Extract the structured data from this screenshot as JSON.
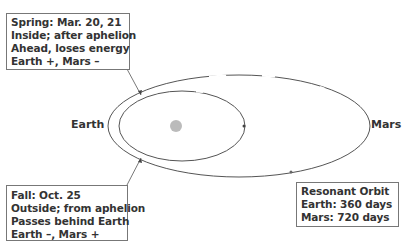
{
  "diagram": {
    "labels": {
      "earth": "Earth",
      "mars": "Mars"
    },
    "spring_box": {
      "lines": [
        "Spring: Mar. 20, 21",
        "Inside; after aphelion",
        "Ahead, loses energy",
        "Earth +, Mars –"
      ]
    },
    "fall_box": {
      "lines": [
        "Fall: Oct. 25",
        "Outside; from aphelion",
        "Passes behind Earth",
        "Earth –, Mars +"
      ]
    },
    "resonant_box": {
      "lines": [
        "Resonant Orbit",
        "Earth: 360 days",
        "Mars: 720 days"
      ]
    },
    "colors": {
      "orbit_line": "#555555",
      "sun": "#bbbbbb",
      "box_border": "#777777",
      "text": "#333333"
    }
  }
}
